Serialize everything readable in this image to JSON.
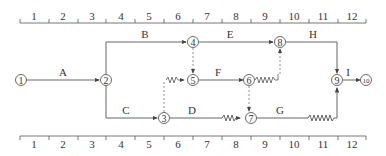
{
  "timescale": {
    "ticks_top": [
      "1",
      "2",
      "3",
      "4",
      "5",
      "6",
      "7",
      "8",
      "9",
      "10",
      "11",
      "12"
    ],
    "ticks_bottom": [
      "1",
      "2",
      "3",
      "4",
      "5",
      "6",
      "7",
      "8",
      "9",
      "10",
      "11",
      "12"
    ]
  },
  "nodes": [
    {
      "id": "1",
      "label": "①"
    },
    {
      "id": "2",
      "label": "②"
    },
    {
      "id": "3",
      "label": "③"
    },
    {
      "id": "4",
      "label": "④"
    },
    {
      "id": "5",
      "label": "⑤"
    },
    {
      "id": "6",
      "label": "⑥"
    },
    {
      "id": "7",
      "label": "⑦"
    },
    {
      "id": "8",
      "label": "⑧"
    },
    {
      "id": "9",
      "label": "⑨"
    },
    {
      "id": "10",
      "label": "⑩"
    }
  ],
  "activities": {
    "A": "A",
    "B": "B",
    "C": "C",
    "D": "D",
    "E": "E",
    "F": "F",
    "G": "G",
    "H": "H",
    "I": "I"
  },
  "colors": {
    "line": "#555555",
    "text": "#333333",
    "dashed": "#777777"
  }
}
